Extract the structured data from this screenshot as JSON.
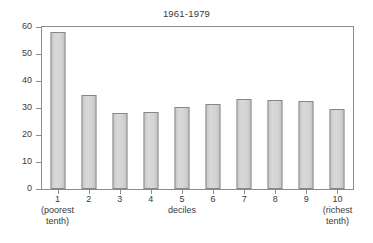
{
  "chart_data": {
    "type": "bar",
    "title": "1961-1979",
    "xlabel": "deciles",
    "ylabel": "",
    "categories": [
      "1",
      "2",
      "3",
      "4",
      "5",
      "6",
      "7",
      "8",
      "9",
      "10"
    ],
    "values": [
      58,
      35,
      28,
      28.5,
      30.5,
      31.5,
      33.5,
      33,
      32.5,
      29.5
    ],
    "ylim": [
      0,
      60
    ],
    "yticks": [
      0,
      10,
      20,
      30,
      40,
      50,
      60
    ],
    "ytick_labels": [
      "0",
      "10",
      "20",
      "30",
      "40",
      "50",
      "60"
    ],
    "category_sublabels": {
      "1": "(poorest\ntenth)",
      "10": "(richest\ntenth)"
    },
    "grid": false,
    "legend": null,
    "colors": {
      "bar_fill": "#d2d2d2",
      "bar_edge": "#878787",
      "axis": "#8c8c8c",
      "text": "#3a3a3a",
      "background": "#ffffff"
    }
  }
}
